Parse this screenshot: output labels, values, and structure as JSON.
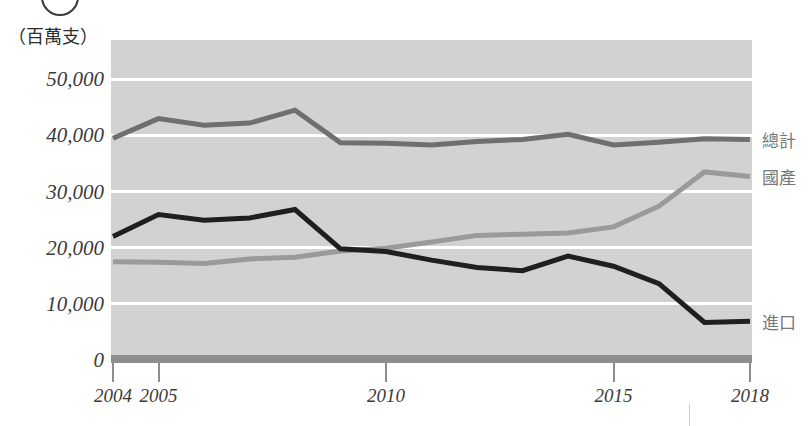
{
  "figure": {
    "badge": "",
    "unit_label": "（百萬支）"
  },
  "axis": {
    "y_ticks": [
      "0",
      "10,000",
      "20,000",
      "30,000",
      "40,000",
      "50,000"
    ],
    "x_ticks": [
      "2004",
      "2005",
      "2010",
      "2015",
      "2018"
    ]
  },
  "legend": {
    "total": "總計",
    "domestic": "國產",
    "import": "進口"
  },
  "colors": {
    "plot_background": "#d2d2d2",
    "gridline": "#ffffff",
    "total_line": "#6f6f6f",
    "domestic_line": "#9a9a9a",
    "import_line": "#1f1f1f",
    "axis": "#8e8e8e",
    "text": "#3a3a3a",
    "legend_text": "#777777"
  },
  "chart_data": {
    "type": "line",
    "title": "",
    "subtitle": "",
    "xlabel": "",
    "ylabel": "（百萬支）",
    "ylim": [
      0,
      57000
    ],
    "xlim": [
      2004,
      2018
    ],
    "grid": true,
    "legend_position": "right",
    "x": [
      2004,
      2005,
      2006,
      2007,
      2008,
      2009,
      2010,
      2011,
      2012,
      2013,
      2014,
      2015,
      2016,
      2017,
      2018
    ],
    "x_tick_labels": [
      "2004",
      "2005",
      "2010",
      "2015",
      "2018"
    ],
    "y_ticks": [
      0,
      10000,
      20000,
      30000,
      40000,
      50000
    ],
    "series": [
      {
        "name": "總計",
        "color": "#6f6f6f",
        "values": [
          39500,
          43000,
          41800,
          42200,
          44500,
          38700,
          38600,
          38300,
          38900,
          39300,
          40200,
          38300,
          38800,
          39400,
          39300
        ]
      },
      {
        "name": "國產",
        "color": "#9a9a9a",
        "values": [
          17500,
          17400,
          17200,
          18000,
          18300,
          19400,
          19900,
          21000,
          22200,
          22400,
          22600,
          23700,
          27400,
          33500,
          32700
        ]
      },
      {
        "name": "進口",
        "color": "#1f1f1f",
        "values": [
          22000,
          25900,
          24900,
          25300,
          26800,
          19800,
          19300,
          17800,
          16500,
          15900,
          18500,
          16700,
          13600,
          6700,
          6900
        ]
      }
    ]
  }
}
